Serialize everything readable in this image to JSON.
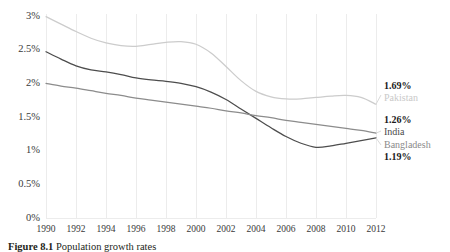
{
  "figure": {
    "caption_prefix": "Figure 8.1",
    "caption_text": "Population growth rates"
  },
  "axes": {
    "y_ticks": [
      "3%",
      "2.5%",
      "2%",
      "1.5%",
      "1%",
      "0.5%",
      "0%"
    ],
    "x_ticks": [
      "1990",
      "1992",
      "1994",
      "1996",
      "1998",
      "2000",
      "2002",
      "2004",
      "2006",
      "2008",
      "2010",
      "2012"
    ]
  },
  "end_labels": [
    {
      "value": "1.69%",
      "name": "Pakistan",
      "color": "#c9c9c9"
    },
    {
      "value": "1.26%",
      "name": "India",
      "color": "#4a4a4a"
    },
    {
      "value": "1.19%",
      "name": "Bangladesh",
      "color": "#8a8a8a"
    }
  ],
  "colors": {
    "pakistan_line": "#cccccc",
    "bangladesh_line": "#4d4d4d",
    "india_line": "#8c8c8c",
    "gridline": "#ececec",
    "text": "#231f20"
  },
  "chart_data": {
    "type": "line",
    "title": "",
    "xlabel": "",
    "ylabel": "",
    "xlim": [
      1990,
      2012
    ],
    "ylim": [
      0,
      3
    ],
    "y_tick_values": [
      3,
      2.5,
      2,
      1.5,
      1,
      0.5,
      0
    ],
    "x_tick_values": [
      1990,
      1992,
      1994,
      1996,
      1998,
      2000,
      2002,
      2004,
      2006,
      2008,
      2010,
      2012
    ],
    "grid": "vertical-only",
    "legend_position": "right-end-labels",
    "y_unit": "percent",
    "x": [
      1990,
      1991,
      1992,
      1993,
      1994,
      1995,
      1996,
      1997,
      1998,
      1999,
      2000,
      2001,
      2002,
      2003,
      2004,
      2005,
      2006,
      2007,
      2008,
      2009,
      2010,
      2011,
      2012
    ],
    "series": [
      {
        "name": "Pakistan",
        "color": "#cccccc",
        "end_value": 1.69,
        "values": [
          2.99,
          2.88,
          2.77,
          2.67,
          2.6,
          2.56,
          2.55,
          2.58,
          2.61,
          2.62,
          2.58,
          2.45,
          2.25,
          2.04,
          1.88,
          1.8,
          1.77,
          1.77,
          1.79,
          1.81,
          1.82,
          1.79,
          1.69
        ]
      },
      {
        "name": "Bangladesh",
        "color": "#4d4d4d",
        "end_value": 1.19,
        "values": [
          2.47,
          2.36,
          2.26,
          2.2,
          2.17,
          2.13,
          2.08,
          2.05,
          2.03,
          2.0,
          1.95,
          1.87,
          1.76,
          1.62,
          1.48,
          1.34,
          1.21,
          1.11,
          1.05,
          1.07,
          1.11,
          1.15,
          1.19
        ]
      },
      {
        "name": "India",
        "color": "#8c8c8c",
        "end_value": 1.26,
        "values": [
          2.0,
          1.96,
          1.93,
          1.89,
          1.85,
          1.82,
          1.78,
          1.75,
          1.72,
          1.69,
          1.66,
          1.63,
          1.59,
          1.56,
          1.52,
          1.49,
          1.45,
          1.42,
          1.39,
          1.36,
          1.33,
          1.3,
          1.26
        ]
      }
    ]
  }
}
